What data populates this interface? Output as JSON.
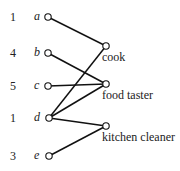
{
  "diagram": {
    "type": "bipartite-graph",
    "left_nodes": [
      {
        "id": "a",
        "label": "a",
        "number": "1",
        "x": 48,
        "y": 17
      },
      {
        "id": "b",
        "label": "b",
        "number": "4",
        "x": 48,
        "y": 53
      },
      {
        "id": "c",
        "label": "c",
        "number": "5",
        "x": 48,
        "y": 86
      },
      {
        "id": "d",
        "label": "d",
        "number": "1",
        "x": 49,
        "y": 118
      },
      {
        "id": "e",
        "label": "e",
        "number": "3",
        "x": 49,
        "y": 156
      }
    ],
    "right_nodes": [
      {
        "id": "cook",
        "label": "cook",
        "x": 106,
        "y": 46
      },
      {
        "id": "food_taster",
        "label": "food taster",
        "x": 106,
        "y": 84
      },
      {
        "id": "kitchen_cleaner",
        "label": "kitchen cleaner",
        "x": 106,
        "y": 126
      }
    ],
    "edges": [
      {
        "from": "a",
        "to": "cook"
      },
      {
        "from": "b",
        "to": "food_taster"
      },
      {
        "from": "c",
        "to": "food_taster"
      },
      {
        "from": "d",
        "to": "cook"
      },
      {
        "from": "d",
        "to": "food_taster"
      },
      {
        "from": "d",
        "to": "kitchen_cleaner"
      },
      {
        "from": "e",
        "to": "kitchen_cleaner"
      }
    ],
    "colors": {
      "line": "#111111",
      "text": "#222222",
      "background": "#ffffff"
    }
  }
}
